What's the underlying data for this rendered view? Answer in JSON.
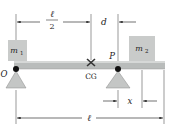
{
  "diagram": {
    "colors": {
      "beam": "#b9bcbb",
      "beam_highlight": "#d6d8d7",
      "block": "#c9cbca",
      "support": "#c4c6c5",
      "pivot_dot": "#111111",
      "line": "#333333",
      "text": "#222222"
    },
    "labels": {
      "m1": "m",
      "m1_sub": "1",
      "m2": "m",
      "m2_sub": "2",
      "pivot_o": "O",
      "pivot_p": "P",
      "cg": "CG",
      "half_length_num": "ℓ",
      "half_length_den": "2",
      "offset_d": "d",
      "offset_x": "x",
      "length": "ℓ"
    },
    "dimensions": [
      {
        "name": "half-length",
        "label": "ℓ/2",
        "from": "O",
        "to": "CG"
      },
      {
        "name": "d",
        "label": "d",
        "from": "CG",
        "to": "P"
      },
      {
        "name": "x",
        "label": "x",
        "from": "P",
        "to": "m2-center"
      },
      {
        "name": "length",
        "label": "ℓ",
        "from": "O",
        "to": "beam-end"
      }
    ]
  }
}
